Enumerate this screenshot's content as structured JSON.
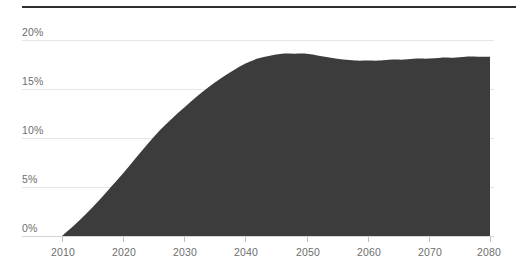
{
  "chart_data": {
    "type": "area",
    "title": "",
    "subtitle": "",
    "xlabel": "",
    "ylabel": "",
    "xlim": [
      2010,
      2080
    ],
    "ylim": [
      0,
      20
    ],
    "grid": true,
    "legend": null,
    "series_color": "#3c3c3c",
    "x_tick_labels": [
      "2010",
      "2020",
      "2030",
      "2040",
      "2050",
      "2060",
      "2070",
      "2080"
    ],
    "x_ticks": [
      2010,
      2020,
      2030,
      2040,
      2050,
      2060,
      2070,
      2080
    ],
    "y_tick_labels": [
      "0%",
      "5%",
      "10%",
      "15%",
      "20%"
    ],
    "y_ticks": [
      0,
      5,
      10,
      15,
      20
    ],
    "x": [
      2010,
      2012,
      2014,
      2016,
      2018,
      2020,
      2022,
      2024,
      2026,
      2028,
      2030,
      2032,
      2034,
      2036,
      2038,
      2040,
      2042,
      2044,
      2046,
      2048,
      2050,
      2052,
      2054,
      2056,
      2058,
      2060,
      2062,
      2064,
      2066,
      2068,
      2070,
      2072,
      2074,
      2076,
      2078,
      2080
    ],
    "values": [
      0.0,
      1.1,
      2.3,
      3.6,
      5.0,
      6.4,
      7.9,
      9.4,
      10.8,
      12.0,
      13.1,
      14.2,
      15.2,
      16.1,
      16.9,
      17.6,
      18.1,
      18.4,
      18.6,
      18.6,
      18.6,
      18.4,
      18.2,
      18.0,
      17.9,
      17.9,
      17.9,
      18.0,
      18.0,
      18.1,
      18.1,
      18.2,
      18.2,
      18.3,
      18.3,
      18.3
    ],
    "peak": {
      "x": 2049,
      "y": 18.6
    },
    "end_value": 18.3,
    "start_value": 0.0
  },
  "axis": {
    "y_labels": [
      "20%",
      "15%",
      "10%",
      "5%",
      "0%"
    ],
    "x_labels": [
      "2010",
      "2020",
      "2030",
      "2040",
      "2050",
      "2060",
      "2070",
      "2080"
    ]
  },
  "colors": {
    "area_fill": "#3c3c3c",
    "gridline": "#e6e6e6",
    "tick_text": "#6e6e6e",
    "top_rule": "#2f2f2f",
    "background": "#ffffff"
  }
}
